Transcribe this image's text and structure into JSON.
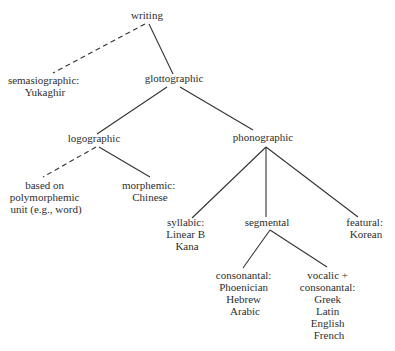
{
  "diagram": {
    "type": "tree",
    "topic": "classification of writing systems",
    "nodes": {
      "writing": {
        "lines": [
          "writing"
        ]
      },
      "semasiographic": {
        "lines": [
          "semasiographic:",
          "Yukaghir"
        ]
      },
      "glottographic": {
        "lines": [
          "glottographic"
        ]
      },
      "logographic": {
        "lines": [
          "logographic"
        ]
      },
      "phonographic": {
        "lines": [
          "phonographic"
        ]
      },
      "polymorphemic": {
        "lines": [
          "based on",
          "polymorphemic",
          "unit (e.g., word)"
        ]
      },
      "morphemic": {
        "lines": [
          "morphemic:",
          "Chinese"
        ]
      },
      "syllabic": {
        "lines": [
          "syllabic:",
          "Linear B",
          "Kana"
        ]
      },
      "segmental": {
        "lines": [
          "segmental"
        ]
      },
      "featural": {
        "lines": [
          "featural:",
          "Korean"
        ]
      },
      "consonantal": {
        "lines": [
          "consonantal:",
          "Phoenician",
          "Hebrew",
          "Arabic"
        ]
      },
      "vocalic_consonantal": {
        "lines": [
          "vocalic +",
          "consonantal:",
          "Greek",
          "Latin",
          "English",
          "French"
        ]
      }
    },
    "edges": [
      {
        "from": "writing",
        "to": "semasiographic",
        "style": "dashed"
      },
      {
        "from": "writing",
        "to": "glottographic",
        "style": "solid"
      },
      {
        "from": "glottographic",
        "to": "logographic",
        "style": "solid"
      },
      {
        "from": "glottographic",
        "to": "phonographic",
        "style": "solid"
      },
      {
        "from": "logographic",
        "to": "polymorphemic",
        "style": "dashed"
      },
      {
        "from": "logographic",
        "to": "morphemic",
        "style": "solid"
      },
      {
        "from": "phonographic",
        "to": "syllabic",
        "style": "solid"
      },
      {
        "from": "phonographic",
        "to": "segmental",
        "style": "solid"
      },
      {
        "from": "phonographic",
        "to": "featural",
        "style": "solid"
      },
      {
        "from": "segmental",
        "to": "consonantal",
        "style": "solid"
      },
      {
        "from": "segmental",
        "to": "vocalic_consonantal",
        "style": "solid"
      }
    ],
    "colors": {
      "text": "#2e2e2e",
      "line": "#333333",
      "background": "#ffffff"
    }
  }
}
